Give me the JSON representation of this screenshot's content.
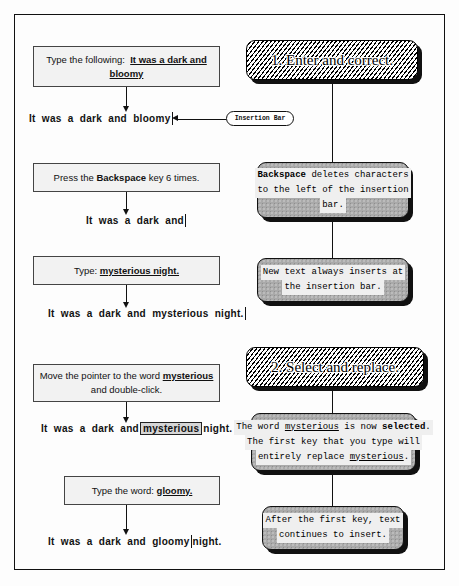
{
  "diagram": {
    "colors": {
      "ink": "#111111",
      "note_fill": "#a9a9a9",
      "instruction_fill": "#f2f2f2",
      "selection_highlight": "#d6d6d6",
      "shadow": "#111111"
    }
  },
  "sections": [
    {
      "number": "1.",
      "label": "1. Enter and correct."
    },
    {
      "number": "2.",
      "label": "2. Select and replace."
    }
  ],
  "steps": [
    {
      "id": "step-type-following",
      "instruction_lines": [
        {
          "plain": "Type the following:  ",
          "underlined": "It was a dark and"
        },
        {
          "plain": "",
          "underlined": "bloomy"
        }
      ],
      "result_prefix": "It was a dark and bloomy",
      "result_suffix": "",
      "caret": true,
      "selected": ""
    },
    {
      "id": "step-backspace",
      "instruction_lines": [
        {
          "plain_before": "Press the ",
          "bold": "Backspace",
          "plain_after": " key 6 times."
        }
      ],
      "result_prefix": "It was a dark and",
      "result_suffix": "",
      "caret": true,
      "selected": ""
    },
    {
      "id": "step-type-mysterious",
      "instruction_lines": [
        {
          "plain": "Type: ",
          "underlined": "mysterious night."
        }
      ],
      "result_prefix": "It was a dark and mysterious night.",
      "result_suffix": "",
      "caret": true,
      "selected": ""
    },
    {
      "id": "step-double-click",
      "instruction_lines": [
        {
          "plain": "Move the pointer to the word ",
          "underlined": "mysterious"
        },
        {
          "plain": "and double-click.",
          "underlined": ""
        }
      ],
      "result_prefix": "It was a dark and",
      "selected": "mysterious",
      "result_suffix": "night.",
      "caret": false
    },
    {
      "id": "step-type-gloomy",
      "instruction_lines": [
        {
          "plain": "Type the word: ",
          "underlined": "gloomy."
        }
      ],
      "result_prefix": "It was a dark and gloomy",
      "result_suffix": "night.",
      "caret": true,
      "selected": ""
    }
  ],
  "callout": {
    "insertion_bar_label": "Insertion Bar"
  },
  "notes": [
    {
      "id": "note-backspace",
      "lines": [
        {
          "bold": "Backspace",
          "rest": " deletes characters"
        },
        {
          "bold": "",
          "rest": "to the left of the insertion"
        },
        {
          "bold": "",
          "rest": "bar."
        }
      ]
    },
    {
      "id": "note-new-text",
      "lines": [
        {
          "bold": "",
          "rest": "New text always inserts at"
        },
        {
          "bold": "",
          "rest": "the insertion bar."
        }
      ]
    },
    {
      "id": "note-selected",
      "lines": [
        {
          "bold": "",
          "rest": "The word mysterious is now selected."
        },
        {
          "bold": "",
          "rest": "The first key that you type will"
        },
        {
          "bold": "",
          "rest": "entirely replace mysterious."
        }
      ]
    },
    {
      "id": "note-continues",
      "lines": [
        {
          "bold": "",
          "rest": "After the first key, text"
        },
        {
          "bold": "",
          "rest": "continues to insert."
        }
      ]
    }
  ]
}
